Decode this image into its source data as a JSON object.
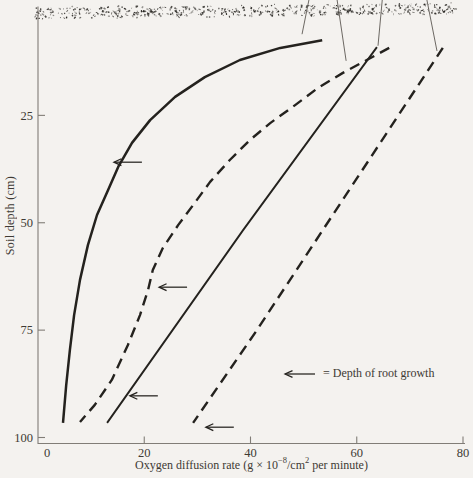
{
  "figure": {
    "background": "#f4f2ef",
    "ink": "#24221e",
    "axis_color": "#817d77",
    "text_color": "#3e3a34",
    "leader_color": "#5c5852"
  },
  "chart_data": {
    "type": "line",
    "title": "",
    "xlabel_text": "Oxygen diffusion rate (g × 10⁻⁸/cm² per minute)",
    "xlabel_parts": {
      "pre": "Oxygen diffusion rate (g × 10",
      "sup1": "−8",
      "mid": "/cm",
      "sup2": "2",
      "post": " per minute)"
    },
    "ylabel": "Soil depth (cm)",
    "xlim": [
      0,
      80
    ],
    "ylim_depth": [
      0,
      100
    ],
    "x_ticks": [
      0,
      20,
      40,
      60,
      80
    ],
    "y_ticks": [
      25,
      50,
      75,
      100
    ],
    "grid": false,
    "legend": {
      "symbol": "left-arrow",
      "label": "= Depth of root growth",
      "position": "lower-right"
    },
    "surface_band": {
      "depth": 0,
      "texture": "stippled-soil-surface"
    },
    "series": [
      {
        "id": "curve-1",
        "line": "solid",
        "points": [
          [
            53.5,
            7.5
          ],
          [
            45.6,
            9.3
          ],
          [
            38,
            12.1
          ],
          [
            31.4,
            16.1
          ],
          [
            25.8,
            20.7
          ],
          [
            21.1,
            26.1
          ],
          [
            17.7,
            31.4
          ],
          [
            15.1,
            37
          ],
          [
            13.2,
            42.4
          ],
          [
            11.1,
            48.2
          ],
          [
            9.4,
            55.2
          ],
          [
            7.9,
            63.3
          ],
          [
            6.8,
            71.5
          ],
          [
            6,
            79.6
          ],
          [
            5.3,
            87.8
          ],
          [
            4.7,
            96.6
          ]
        ]
      },
      {
        "id": "curve-2",
        "line": "dashed",
        "points": [
          [
            66.1,
            9.3
          ],
          [
            61.9,
            12.1
          ],
          [
            57.4,
            15.1
          ],
          [
            52.7,
            18.6
          ],
          [
            48.4,
            22.6
          ],
          [
            43.7,
            26.8
          ],
          [
            39.9,
            30.7
          ],
          [
            36.1,
            35.4
          ],
          [
            32.4,
            40.5
          ],
          [
            29.2,
            45.9
          ],
          [
            26.4,
            50.5
          ],
          [
            23.5,
            55.9
          ],
          [
            21.6,
            61
          ],
          [
            20.7,
            65.7
          ],
          [
            19.2,
            71.5
          ],
          [
            16.9,
            78.5
          ],
          [
            13.9,
            86.6
          ],
          [
            10.7,
            92.4
          ],
          [
            7.9,
            96.4
          ]
        ]
      },
      {
        "id": "curve-3",
        "line": "solid",
        "points": [
          [
            63.8,
            9.1
          ],
          [
            38.6,
            51.7
          ],
          [
            13,
            96.6
          ]
        ]
      },
      {
        "id": "curve-4",
        "line": "dashed",
        "points": [
          [
            76.2,
            9.3
          ],
          [
            41.2,
            75
          ],
          [
            29.2,
            96.6
          ]
        ]
      }
    ],
    "root_depth_arrows": [
      {
        "curve": "curve-1",
        "rate": 14.1,
        "depth": 35.9
      },
      {
        "curve": "curve-2",
        "rate": 22.6,
        "depth": 65
      },
      {
        "curve": "curve-3",
        "rate": 17.1,
        "depth": 90.3
      },
      {
        "curve": "curve-4",
        "rate": 31.4,
        "depth": 97.6
      }
    ],
    "leader_lines_to_clipped_labels": [
      {
        "x1": 51,
        "d1": -1.9,
        "x2": 49.7,
        "d2": 6.1
      },
      {
        "x1": 56.3,
        "d1": -1.9,
        "x2": 58,
        "d2": 12.3
      },
      {
        "x1": 64.8,
        "d1": -1.9,
        "x2": 64,
        "d2": 8.8
      },
      {
        "x1": 73.2,
        "d1": -1.9,
        "x2": 75.1,
        "d2": 10
      }
    ]
  }
}
